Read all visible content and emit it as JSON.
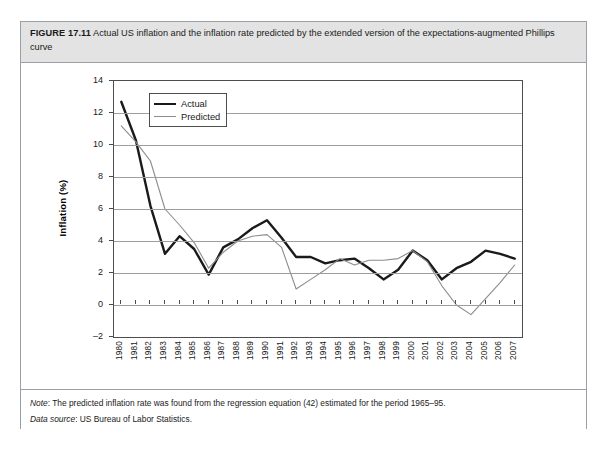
{
  "figure": {
    "label": "FIGURE 17.11",
    "caption": "Actual US inflation and the inflation rate predicted by the extended version of the expectations-augmented Phillips curve"
  },
  "notes": {
    "note_lead": "Note",
    "note_text": ": The predicted inflation rate was found from the regression equation (42) estimated for the period 1965–95.",
    "source_lead": "Data source",
    "source_text": ": US Bureau of Labor Statistics."
  },
  "colors": {
    "actual": "#1a1a1a",
    "predicted": "#8c8c8c",
    "gridline": "#9d9d9d",
    "frame": "#4d4d4d",
    "caption_background": "#e3e3e3",
    "figure_border": "#9aa0a6"
  },
  "chart_data": {
    "type": "line",
    "title": "Actual US inflation and the inflation rate predicted by the extended version of the expectations-augmented Phillips curve",
    "xlabel": "Year",
    "ylabel": "Inflation (%)",
    "ylim": [
      -2,
      14
    ],
    "ytick_step": 2,
    "yticks": [
      -2,
      0,
      2,
      4,
      6,
      8,
      10,
      12,
      14
    ],
    "grid": true,
    "legend_position": "top-left-inside",
    "categories": [
      "1980",
      "1981",
      "1982",
      "1983",
      "1984",
      "1985",
      "1986",
      "1987",
      "1988",
      "1989",
      "1990",
      "1991",
      "1992",
      "1993",
      "1994",
      "1995",
      "1996",
      "1997",
      "1998",
      "1999",
      "2000",
      "2001",
      "2002",
      "2003",
      "2004",
      "2005",
      "2006",
      "2007"
    ],
    "series": [
      {
        "name": "Actual",
        "color": "#1a1a1a",
        "width": 2.4,
        "values": [
          12.7,
          10.3,
          6.2,
          3.2,
          4.3,
          3.5,
          1.9,
          3.6,
          4.1,
          4.8,
          5.3,
          4.2,
          3.0,
          3.0,
          2.6,
          2.8,
          2.9,
          2.3,
          1.6,
          2.2,
          3.4,
          2.8,
          1.6,
          2.3,
          2.7,
          3.4,
          3.2,
          2.9
        ]
      },
      {
        "name": "Predicted",
        "color": "#8c8c8c",
        "width": 1.1,
        "values": [
          11.2,
          10.2,
          9.0,
          6.0,
          5.0,
          3.9,
          2.3,
          3.3,
          4.0,
          4.3,
          4.4,
          3.6,
          1.0,
          1.6,
          2.2,
          2.9,
          2.5,
          2.8,
          2.8,
          2.9,
          3.4,
          2.7,
          1.2,
          0.0,
          -0.6,
          0.4,
          1.4,
          2.5
        ]
      }
    ]
  }
}
